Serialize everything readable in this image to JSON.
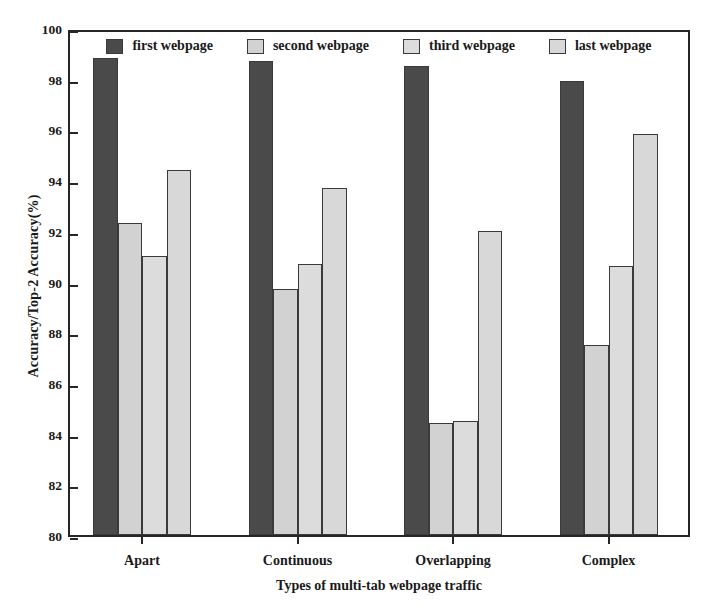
{
  "chart_data": {
    "type": "bar",
    "title": "",
    "xlabel": "Types of multi-tab webpage traffic",
    "ylabel": "Accuracy/Top-2 Accuracy(%)",
    "categories": [
      "Apart",
      "Continuous",
      "Overlapping",
      "Complex"
    ],
    "series": [
      {
        "name": "first webpage",
        "color": "#4a4a4a",
        "values": [
          98.8,
          98.7,
          98.5,
          97.9
        ]
      },
      {
        "name": "second webpage",
        "color": "#d2d2d2",
        "values": [
          92.3,
          89.7,
          84.4,
          87.5
        ]
      },
      {
        "name": "third webpage",
        "color": "#dcdcdc",
        "values": [
          91.0,
          90.7,
          84.5,
          90.6
        ]
      },
      {
        "name": "last webpage",
        "color": "#d8d8d8",
        "values": [
          94.4,
          93.7,
          92.0,
          95.8
        ]
      }
    ],
    "ylim": [
      80,
      100
    ],
    "yticks": [
      80,
      82,
      84,
      86,
      88,
      90,
      92,
      94,
      96,
      98,
      100
    ],
    "ytick_labels": [
      "80",
      "82",
      "84",
      "86",
      "88",
      "90",
      "92",
      "94",
      "96",
      "98",
      "100"
    ],
    "grid": false,
    "legend_position": "top-center"
  }
}
